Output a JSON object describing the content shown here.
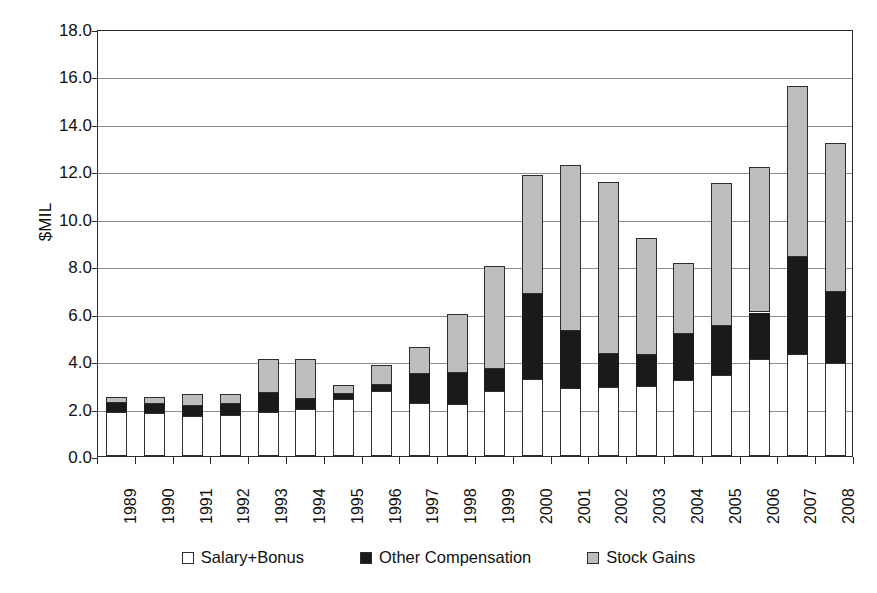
{
  "chart_data": {
    "type": "bar",
    "subtype": "stacked-bar",
    "title": "",
    "xlabel": "",
    "ylabel": "$MIL",
    "ylim": [
      0.0,
      18.0
    ],
    "ytick_step": 2.0,
    "ytick_labels": [
      "18.0",
      "16.0",
      "14.0",
      "12.0",
      "10.0",
      "8.0",
      "6.0",
      "4.0",
      "2.0",
      "0.0"
    ],
    "ytick_values": [
      18.0,
      16.0,
      14.0,
      12.0,
      10.0,
      8.0,
      6.0,
      4.0,
      2.0,
      0.0
    ],
    "grid": true,
    "grid_axis": "y",
    "legend_position": "bottom",
    "categories": [
      "1989",
      "1990",
      "1991",
      "1992",
      "1993",
      "1994",
      "1995",
      "1996",
      "1997",
      "1998",
      "1999",
      "2000",
      "2001",
      "2002",
      "2003",
      "2004",
      "2005",
      "2006",
      "2007",
      "2008"
    ],
    "series": [
      {
        "name": "Salary+Bonus",
        "color": "#ffffff",
        "values": [
          1.85,
          1.8,
          1.7,
          1.75,
          1.85,
          2.0,
          2.4,
          2.75,
          2.25,
          2.2,
          2.75,
          3.25,
          2.85,
          2.9,
          2.95,
          3.2,
          3.4,
          4.1,
          4.3,
          3.9
        ]
      },
      {
        "name": "Other Compensation",
        "color": "#1a1a1a",
        "values": [
          0.4,
          0.4,
          0.4,
          0.45,
          0.8,
          0.4,
          0.2,
          0.25,
          1.2,
          1.3,
          0.9,
          3.6,
          2.4,
          1.4,
          1.3,
          1.95,
          2.1,
          1.95,
          4.1,
          3.0
        ]
      },
      {
        "name": "Stock Gains",
        "color": "#bdbdbd",
        "values": [
          0.25,
          0.3,
          0.5,
          0.4,
          1.45,
          1.7,
          0.4,
          0.85,
          1.15,
          2.5,
          4.35,
          5.0,
          7.0,
          7.25,
          4.95,
          3.0,
          6.0,
          6.15,
          7.2,
          6.3
        ]
      }
    ],
    "totals": [
      2.5,
      2.5,
      2.6,
      2.6,
      4.1,
      4.1,
      3.0,
      3.85,
      4.6,
      6.0,
      8.0,
      11.85,
      12.25,
      11.55,
      9.2,
      8.15,
      11.5,
      12.2,
      15.6,
      13.2
    ],
    "annotations": []
  },
  "legend": {
    "items": [
      {
        "label": "Salary+Bonus",
        "swatch": "white"
      },
      {
        "label": "Other Compensation",
        "swatch": "black"
      },
      {
        "label": "Stock Gains",
        "swatch": "gray"
      }
    ]
  }
}
